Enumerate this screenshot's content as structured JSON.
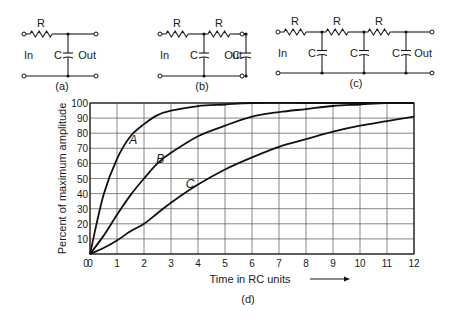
{
  "circuits": [
    {
      "id": "a",
      "caption": "(a)",
      "sections": 1,
      "resistor_label": "R",
      "capacitor_label": "C",
      "input_label": "In",
      "output_label": "Out"
    },
    {
      "id": "b",
      "caption": "(b)",
      "sections": 2,
      "resistor_label": "R",
      "capacitor_label": "C",
      "input_label": "In",
      "output_label": "Out"
    },
    {
      "id": "c",
      "caption": "(c)",
      "sections": 3,
      "resistor_label": "R",
      "capacitor_label": "C",
      "input_label": "In",
      "output_label": "Out"
    }
  ],
  "chart_caption": "(d)",
  "x_arrow": "arrow-right",
  "chart_data": {
    "type": "line",
    "title": "",
    "xlabel": "Time in RC units",
    "ylabel": "Percent of maximum amplitude",
    "xlim": [
      0,
      12
    ],
    "ylim": [
      0,
      100
    ],
    "x_ticks": [
      "0",
      "1",
      "2",
      "3",
      "4",
      "5",
      "6",
      "7",
      "8",
      "9",
      "10",
      "11",
      "12"
    ],
    "y_ticks": [
      "0",
      "10",
      "20",
      "30",
      "40",
      "50",
      "60",
      "70",
      "80",
      "90",
      "100"
    ],
    "grid": true,
    "legend": "inline curve labels",
    "series": [
      {
        "name": "A",
        "label": "A",
        "x": [
          0,
          0.5,
          1,
          1.5,
          2,
          2.5,
          3,
          4,
          5,
          6,
          8,
          10,
          12
        ],
        "y": [
          0,
          39,
          63,
          78,
          86,
          92,
          95,
          98,
          99,
          100,
          100,
          100,
          100
        ]
      },
      {
        "name": "B",
        "label": "B",
        "x": [
          0,
          0.5,
          1,
          1.5,
          2,
          2.5,
          3,
          4,
          5,
          6,
          7,
          8,
          9,
          10,
          11,
          12
        ],
        "y": [
          0,
          12,
          26,
          39,
          50,
          60,
          67,
          78,
          85,
          91,
          94,
          96,
          98,
          99,
          100,
          100
        ]
      },
      {
        "name": "C",
        "label": "C",
        "x": [
          0,
          0.5,
          1,
          1.5,
          2,
          2.5,
          3,
          4,
          5,
          6,
          7,
          8,
          9,
          10,
          11,
          12
        ],
        "y": [
          0,
          4,
          9,
          15,
          20,
          27,
          34,
          46,
          56,
          64,
          71,
          76,
          81,
          85,
          88,
          91
        ]
      }
    ]
  }
}
